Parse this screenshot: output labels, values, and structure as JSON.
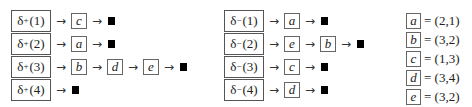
{
  "diagram": {
    "plus_lists": {
      "symbol": "δ",
      "sign": "+",
      "rows": [
        {
          "label": "(1)",
          "nodes": [
            "c"
          ]
        },
        {
          "label": "(2)",
          "nodes": [
            "a"
          ]
        },
        {
          "label": "(3)",
          "nodes": [
            "b",
            "d",
            "e"
          ]
        },
        {
          "label": "(4)",
          "nodes": []
        }
      ]
    },
    "minus_lists": {
      "symbol": "δ",
      "sign": "−",
      "rows": [
        {
          "label": "(1)",
          "nodes": [
            "a"
          ]
        },
        {
          "label": "(2)",
          "nodes": [
            "e",
            "b"
          ]
        },
        {
          "label": "(3)",
          "nodes": [
            "c"
          ]
        },
        {
          "label": "(4)",
          "nodes": [
            "d"
          ]
        }
      ]
    },
    "arrow_glyph": "→",
    "terminator": "■",
    "legend": [
      {
        "node": "a",
        "value": "= (2,1)"
      },
      {
        "node": "b",
        "value": "= (3,2)"
      },
      {
        "node": "c",
        "value": "= (1,3)"
      },
      {
        "node": "d",
        "value": "= (3,4)"
      },
      {
        "node": "e",
        "value": "= (3,2)"
      }
    ]
  }
}
